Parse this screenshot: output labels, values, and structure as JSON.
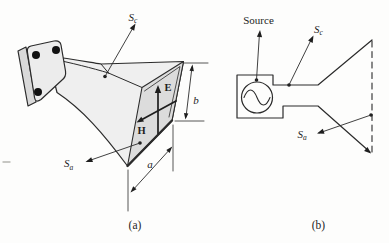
{
  "figure": {
    "background": "#fdfdfc",
    "line_color": "#2b2b2b",
    "fill_body": "#efefef",
    "fill_flange_side": "#d9d9d9",
    "fill_flange_front": "#ececec",
    "fill_aperture": "#dcdcdc",
    "bolt_color": "#111111",
    "panel_a": {
      "caption": "(a)",
      "labels": {
        "surface_c": {
          "base": "S",
          "sub": "c"
        },
        "surface_a": {
          "base": "S",
          "sub": "a"
        },
        "e_field": "E",
        "h_field": "H",
        "dim_width": "a",
        "dim_height": "b"
      }
    },
    "panel_b": {
      "caption": "(b)",
      "source_label": "Source",
      "labels": {
        "surface_c": {
          "base": "S",
          "sub": "c"
        },
        "surface_a": {
          "base": "S",
          "sub": "a"
        }
      }
    }
  }
}
